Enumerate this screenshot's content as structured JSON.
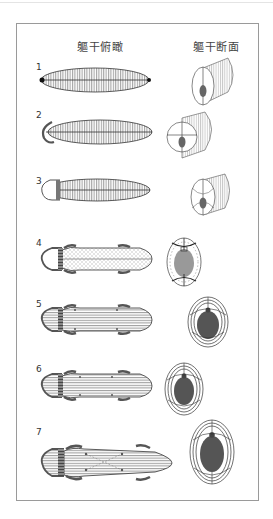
{
  "headings": {
    "top_view": "軀干俯瞰",
    "cross_section": "軀干断面"
  },
  "stages": [
    {
      "label": "1",
      "y": 70
    },
    {
      "label": "2",
      "y": 118
    },
    {
      "label": "3",
      "y": 164
    },
    {
      "label": "4",
      "y": 244
    },
    {
      "label": "5",
      "y": 304
    },
    {
      "label": "6",
      "y": 366
    },
    {
      "label": "7",
      "y": 428
    }
  ],
  "caption": "",
  "colors": {
    "line": "#333333",
    "organ_fill": "#555555",
    "organ_fill_light": "#999999",
    "frame": "#9a9a9a"
  }
}
